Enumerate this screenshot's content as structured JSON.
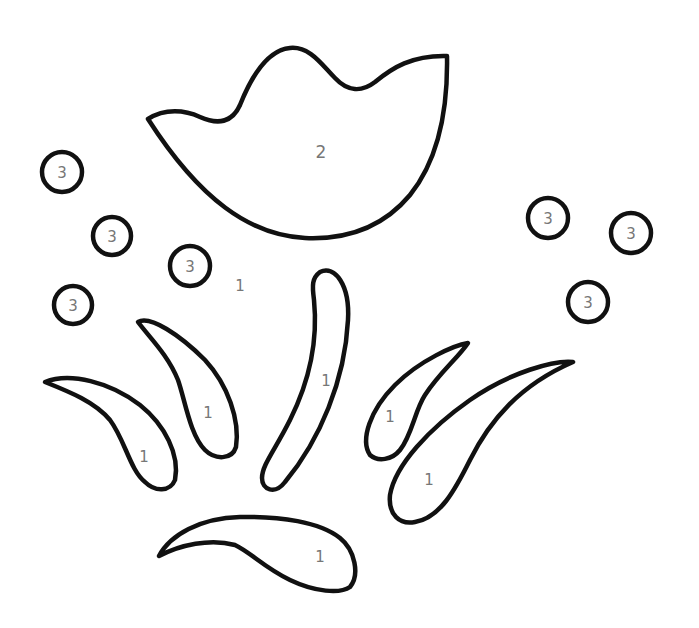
{
  "colors": {
    "stroke": "#111111",
    "label": "#777777",
    "background": "#ffffff"
  },
  "flower": {
    "label": "2"
  },
  "background_region": {
    "label": "1"
  },
  "leaves": [
    {
      "id": "leaf-far-left",
      "label": "1"
    },
    {
      "id": "leaf-left",
      "label": "1"
    },
    {
      "id": "stem",
      "label": "1"
    },
    {
      "id": "leaf-right-small",
      "label": "1"
    },
    {
      "id": "leaf-right-large",
      "label": "1"
    },
    {
      "id": "leaf-bottom",
      "label": "1"
    }
  ],
  "dots": [
    {
      "label": "3"
    },
    {
      "label": "3"
    },
    {
      "label": "3"
    },
    {
      "label": "3"
    },
    {
      "label": "3"
    },
    {
      "label": "3"
    },
    {
      "label": "3"
    }
  ]
}
